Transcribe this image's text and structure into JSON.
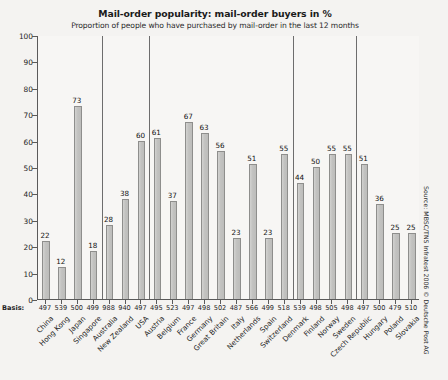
{
  "chart_data": {
    "type": "bar",
    "title": "Mail-order popularity: mail-order buyers in %",
    "subtitle": "Proportion of people who have purchased by mail-order in the last 12 months",
    "xlabel": "",
    "ylabel": "",
    "ylim": [
      0,
      100
    ],
    "ytick_step": 10,
    "yticks": [
      0,
      10,
      20,
      30,
      40,
      50,
      60,
      70,
      80,
      90,
      100
    ],
    "grid": false,
    "legend": "none",
    "value_labels": true,
    "basis_row_label": "Basis:",
    "categories": [
      "China",
      "Hong Kong",
      "Japan",
      "Singapore",
      "Australia",
      "New Zealand",
      "USA",
      "Austria",
      "Belgium",
      "France",
      "Germany",
      "Great Britain",
      "Italy",
      "Netherlands",
      "Spain",
      "Switzerland",
      "Denmark",
      "Finland",
      "Norway",
      "Sweden",
      "Czech Republic",
      "Hungary",
      "Poland",
      "Slovakia"
    ],
    "values": [
      22,
      12,
      73,
      18,
      28,
      38,
      60,
      61,
      37,
      67,
      63,
      56,
      23,
      51,
      23,
      55,
      44,
      50,
      55,
      55,
      51,
      36,
      25,
      25
    ],
    "basis": [
      497,
      539,
      500,
      499,
      988,
      940,
      497,
      495,
      523,
      497,
      498,
      502,
      487,
      566,
      499,
      518,
      539,
      498,
      505,
      498,
      497,
      500,
      479,
      510
    ],
    "groups": [
      {
        "label": "Asia",
        "count": 4
      },
      {
        "label": "USA/Pacific",
        "count": 3
      },
      {
        "label": "Western Europe",
        "count": 9
      },
      {
        "label": "Scandinavia",
        "count": 4
      },
      {
        "label": "Eastern Europe",
        "count": 4
      }
    ],
    "colors": {
      "bar_fill": "#c4c4c2",
      "bar_border": "#8e8e8c",
      "axis": "#5a5a5a",
      "plot_background": "#f7f6f4",
      "page_background": "#f4f3f1",
      "text": "#1f1f1f"
    }
  },
  "source": {
    "text": "Source: MBSC/TNS Infratest 2006 © Deutsche Post AG"
  }
}
